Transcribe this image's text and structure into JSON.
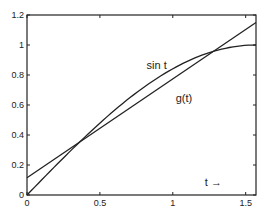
{
  "chart_data": {
    "type": "line",
    "title": "",
    "xlabel": "t →",
    "ylabel": "",
    "xlim": [
      0,
      1.5708
    ],
    "ylim": [
      0,
      1.2
    ],
    "grid": false,
    "x_ticks": [
      "0",
      "0.5",
      "1",
      "1.5"
    ],
    "x_tick_values": [
      0,
      0.5,
      1,
      1.5
    ],
    "y_ticks": [
      "0",
      "0.2",
      "0.4",
      "0.6",
      "0.8",
      "1",
      "1.2"
    ],
    "y_tick_values": [
      0,
      0.2,
      0.4,
      0.6,
      0.8,
      1,
      1.2
    ],
    "series": [
      {
        "name": "sin t",
        "function": "sin(t)",
        "x": [
          0,
          0.2,
          0.4,
          0.6,
          0.8,
          1.0,
          1.2,
          1.4,
          1.5708
        ],
        "values": [
          0,
          0.199,
          0.389,
          0.565,
          0.717,
          0.841,
          0.932,
          0.985,
          1.0
        ]
      },
      {
        "name": "g(t)",
        "function": "linear",
        "x": [
          0,
          1.5708
        ],
        "values": [
          0.115,
          1.15
        ]
      }
    ],
    "annotations": [
      {
        "text": "sin t",
        "x": 0.82,
        "y": 0.84
      },
      {
        "text": "g(t)",
        "x": 1.02,
        "y": 0.62
      },
      {
        "text": "t →",
        "x": 1.22,
        "y": 0.06
      }
    ]
  }
}
